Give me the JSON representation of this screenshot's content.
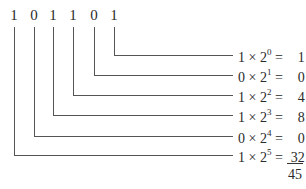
{
  "binary_digits": [
    "1",
    "0",
    "1",
    "1",
    "0",
    "1"
  ],
  "rows": [
    {
      "bit": "1",
      "base": "2",
      "exp": "0",
      "result": "1"
    },
    {
      "bit": "0",
      "base": "2",
      "exp": "1",
      "result": "0"
    },
    {
      "bit": "1",
      "base": "2",
      "exp": "2",
      "result": "4"
    },
    {
      "bit": "1",
      "base": "2",
      "exp": "3",
      "result": "8"
    },
    {
      "bit": "0",
      "base": "2",
      "exp": "4",
      "result": "0"
    },
    {
      "bit": "1",
      "base": "2",
      "exp": "5",
      "result": "32"
    }
  ],
  "symbols": {
    "times": "×",
    "equals": "="
  },
  "total": "45"
}
